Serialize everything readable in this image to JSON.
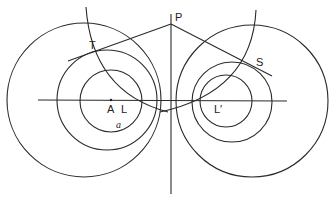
{
  "diagram": {
    "title": "",
    "labels": {
      "P": "P",
      "T": "T",
      "S": "S",
      "A": "A",
      "L": "L",
      "L_prime": "L′",
      "a": "a"
    },
    "left_circles": [
      {
        "name": "outer",
        "cx": 84,
        "cy": 100,
        "r": 77
      },
      {
        "name": "middle",
        "cx": 107,
        "cy": 100,
        "r": 50
      },
      {
        "name": "inner",
        "cx": 111,
        "cy": 101,
        "r": 31
      }
    ],
    "right_circles": [
      {
        "name": "outer",
        "cx": 252,
        "cy": 101,
        "r": 76
      },
      {
        "name": "middle",
        "cx": 232,
        "cy": 102,
        "r": 40
      },
      {
        "name": "inner",
        "cx": 226,
        "cy": 101,
        "r": 26
      }
    ],
    "colors": {
      "stroke": "#2a2a2a",
      "background": "#ffffff"
    }
  }
}
